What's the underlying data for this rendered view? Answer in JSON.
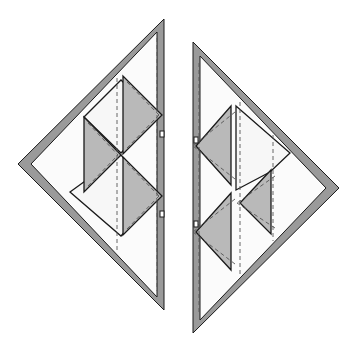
{
  "diagram": {
    "title": "",
    "colors": {
      "border": "#9a9a9a",
      "shaded_patch": "#b9b9b9",
      "background_patch": "#fbfbfb",
      "outline": "#1a1a1a",
      "seam_line": "#555555"
    },
    "pieces": [
      {
        "name": "left-half",
        "outer": [
          [
            164,
            19
          ],
          [
            18,
            164
          ],
          [
            164,
            310
          ]
        ],
        "inner": [
          [
            157,
            32
          ],
          [
            31,
            164
          ],
          [
            157,
            297
          ]
        ],
        "shaded_triangles": [
          [
            [
              123,
              76
            ],
            [
              123,
              154
            ],
            [
              162,
              115
            ]
          ],
          [
            [
              84,
              117
            ],
            [
              84,
              192
            ],
            [
              121,
              155
            ]
          ],
          [
            [
              123,
              157
            ],
            [
              123,
              235
            ],
            [
              162,
              196
            ]
          ]
        ],
        "light_diamonds": [
          [
            [
              84,
              117
            ],
            [
              121,
              80
            ],
            [
              157,
              116
            ],
            [
              121,
              153
            ]
          ],
          [
            [
              70,
              192
            ],
            [
              121,
              155
            ],
            [
              157,
              196
            ],
            [
              121,
              236
            ]
          ]
        ],
        "seams_vertical": [
          117,
          157
        ],
        "notches": [
          [
            162,
            134
          ],
          [
            162,
            214
          ]
        ]
      },
      {
        "name": "right-half",
        "outer": [
          [
            193,
            42
          ],
          [
            193,
            333
          ],
          [
            339,
            188
          ]
        ],
        "inner": [
          [
            200,
            56
          ],
          [
            200,
            320
          ],
          [
            326,
            188
          ]
        ],
        "shaded_triangles": [
          [
            [
              231,
              106
            ],
            [
              231,
              185
            ],
            [
              196,
              146
            ]
          ],
          [
            [
              271,
              170
            ],
            [
              271,
              234
            ],
            [
              240,
              203
            ]
          ],
          [
            [
              231,
              193
            ],
            [
              231,
              270
            ],
            [
              196,
              232
            ]
          ]
        ],
        "light_diamonds": [
          [
            [
              236,
              106
            ],
            [
              290,
              153
            ],
            [
              270,
              172
            ],
            [
              236,
              190
            ]
          ]
        ],
        "seams_vertical": [
          199,
          240,
          273
        ],
        "notches": [
          [
            196,
            140
          ],
          [
            196,
            224
          ]
        ]
      }
    ]
  }
}
